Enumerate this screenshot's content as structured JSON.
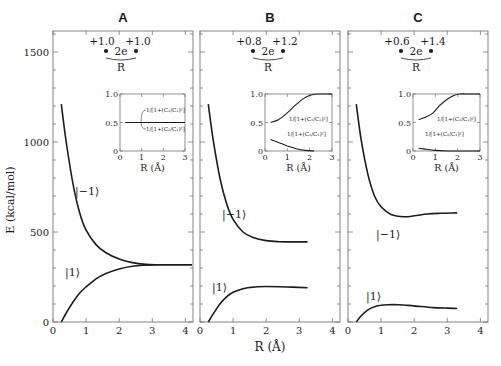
{
  "figure": {
    "y_axis_label": "E  (kcal/mol)",
    "x_axis_label": "R (Å)"
  },
  "chart_data": [
    {
      "type": "line",
      "panel": "A",
      "title": "A",
      "charges": {
        "left": "+1.0",
        "right": "+1.0",
        "center": "2e",
        "distance": "R"
      },
      "xlabel": "R (Å)",
      "ylabel": "E (kcal/mol)",
      "xlim": [
        0,
        4.2
      ],
      "ylim": [
        0,
        1650
      ],
      "x_ticks": [
        "0",
        "1",
        "2",
        "3",
        "4"
      ],
      "y_ticks": [
        "0",
        "500",
        "1000",
        "1500"
      ],
      "series": [
        {
          "name": "|−1⟩",
          "x": [
            0.25,
            0.4,
            0.6,
            0.8,
            1.0,
            1.3,
            1.6,
            2.0,
            2.4,
            2.8,
            3.2,
            3.6,
            4.2
          ],
          "y": [
            1210,
            1000,
            770,
            610,
            510,
            430,
            385,
            350,
            330,
            320,
            318,
            318,
            318
          ]
        },
        {
          "name": "|1⟩",
          "x": [
            0.25,
            0.4,
            0.6,
            0.8,
            1.0,
            1.3,
            1.6,
            2.0,
            2.4,
            2.8,
            3.2,
            3.6,
            4.2
          ],
          "y": [
            0,
            50,
            110,
            160,
            195,
            240,
            270,
            295,
            310,
            316,
            318,
            318,
            318
          ]
        }
      ],
      "inset": {
        "xlabel": "R (Å)",
        "xlim": [
          0,
          3
        ],
        "ylim": [
          0,
          1
        ],
        "x_ticks": [
          "0",
          "1",
          "2",
          "3"
        ],
        "y_ticks": [
          "0",
          "0.5",
          "1.0"
        ],
        "labels": [
          "1/[1+(C₁/C₂)²]",
          "1/[1+(C₂/C₁)²]"
        ],
        "series": [
          {
            "name": "1/[1+(C₁/C₂)²]",
            "x": [
              0.25,
              3
            ],
            "y": [
              0.5,
              0.5
            ]
          },
          {
            "name": "1/[1+(C₂/C₁)²]",
            "x": [
              0.25,
              3
            ],
            "y": [
              0.5,
              0.5
            ]
          }
        ]
      }
    },
    {
      "type": "line",
      "panel": "B",
      "title": "B",
      "charges": {
        "left": "+0.8",
        "right": "+1.2",
        "center": "2e",
        "distance": "R"
      },
      "xlabel": "R (Å)",
      "xlim": [
        0,
        4.2
      ],
      "ylim": [
        0,
        1650
      ],
      "x_ticks": [
        "0",
        "1",
        "2",
        "3",
        "4"
      ],
      "series": [
        {
          "name": "|−1⟩",
          "x": [
            0.25,
            0.4,
            0.6,
            0.8,
            1.0,
            1.3,
            1.6,
            2.0,
            2.4,
            2.8,
            3.25
          ],
          "y": [
            1210,
            1010,
            800,
            660,
            570,
            500,
            470,
            452,
            446,
            445,
            445
          ]
        },
        {
          "name": "|1⟩",
          "x": [
            0.25,
            0.4,
            0.6,
            0.8,
            1.0,
            1.3,
            1.6,
            2.0,
            2.4,
            2.8,
            3.25
          ],
          "y": [
            0,
            45,
            100,
            140,
            165,
            185,
            194,
            197,
            196,
            194,
            190
          ]
        }
      ],
      "inset": {
        "xlabel": "R (Å)",
        "xlim": [
          0,
          3
        ],
        "ylim": [
          0,
          1
        ],
        "x_ticks": [
          "0",
          "1",
          "2",
          "3"
        ],
        "y_ticks": [
          "0",
          "0.5",
          "1.0"
        ],
        "labels": [
          "1/[1+(C₁/C₂)²]",
          "1/[1+(C₂/C₁)²]"
        ],
        "series": [
          {
            "name": "1/[1+(C₁/C₂)²]",
            "x": [
              0.25,
              0.6,
              1.0,
              1.4,
              1.8,
              2.2,
              2.6,
              3.0
            ],
            "y": [
              0.5,
              0.55,
              0.67,
              0.82,
              0.94,
              0.995,
              1.0,
              1.0
            ]
          },
          {
            "name": "1/[1+(C₂/C₁)²]",
            "x": [
              0.25,
              0.6,
              1.0,
              1.4,
              1.8,
              2.2
            ],
            "y": [
              0.2,
              0.15,
              0.09,
              0.04,
              0.01,
              0.0
            ]
          }
        ]
      }
    },
    {
      "type": "line",
      "panel": "C",
      "title": "C",
      "charges": {
        "left": "+0.6",
        "right": "+1.4",
        "center": "2e",
        "distance": "R"
      },
      "xlabel": "R (Å)",
      "xlim": [
        0,
        4.2
      ],
      "ylim": [
        0,
        1650
      ],
      "x_ticks": [
        "0",
        "1",
        "2",
        "3",
        "4"
      ],
      "series": [
        {
          "name": "|−1⟩",
          "x": [
            0.25,
            0.4,
            0.6,
            0.8,
            1.0,
            1.3,
            1.7,
            2.0,
            2.4,
            2.8,
            3.3
          ],
          "y": [
            1210,
            1010,
            820,
            700,
            640,
            598,
            585,
            590,
            600,
            604,
            606
          ]
        },
        {
          "name": "|1⟩",
          "x": [
            0.25,
            0.4,
            0.6,
            0.8,
            1.0,
            1.4,
            1.8,
            2.2,
            2.6,
            3.0,
            3.3
          ],
          "y": [
            0,
            35,
            68,
            85,
            93,
            97,
            92,
            86,
            80,
            77,
            75
          ]
        }
      ],
      "inset": {
        "xlabel": "R (Å)",
        "xlim": [
          0,
          3
        ],
        "ylim": [
          0,
          1
        ],
        "x_ticks": [
          "0",
          "1",
          "2",
          "3"
        ],
        "y_ticks": [
          "0",
          "0.5",
          "1.0"
        ],
        "labels": [
          "1/[1+(C₁/C₂)²]",
          "1/[1+(C₂/C₁)²]"
        ],
        "series": [
          {
            "name": "1/[1+(C₁/C₂)²]",
            "x": [
              0.25,
              0.6,
              0.9,
              1.2,
              1.5,
              1.8,
              2.1,
              2.5,
              3.0
            ],
            "y": [
              0.55,
              0.6,
              0.67,
              0.8,
              0.9,
              0.97,
              1.0,
              1.0,
              1.0
            ]
          },
          {
            "name": "1/[1+(C₂/C₁)²]",
            "x": [
              0.25,
              0.6,
              1.0,
              1.5,
              2.0,
              3.0
            ],
            "y": [
              0.05,
              0.03,
              0.01,
              0.0,
              0.0,
              0.0
            ]
          }
        ]
      }
    }
  ]
}
